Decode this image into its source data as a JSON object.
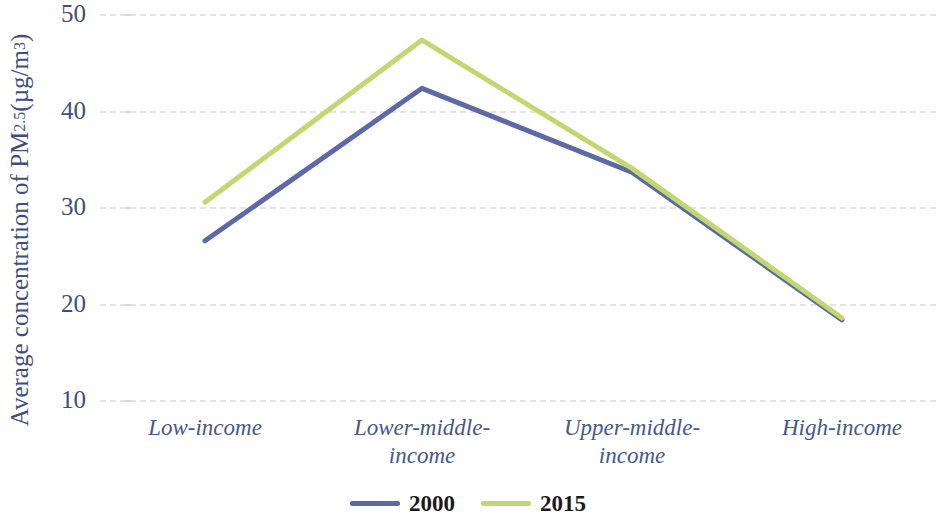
{
  "chart_data": {
    "type": "line",
    "title": "",
    "xlabel": "",
    "ylabel": "Average concentration of PM2.5 (µg/m³)",
    "ylabel_parts": {
      "prefix": "Average concentration of PM",
      "subscript": "2.5",
      "unit_open": " (µg/m",
      "superscript": "3",
      "unit_close": ")"
    },
    "categories": [
      "Low-income",
      "Lower-middle-income",
      "Upper-middle-income",
      "High-income"
    ],
    "category_lines": [
      [
        "Low-income"
      ],
      [
        "Lower-middle-",
        "income"
      ],
      [
        "Upper-middle-",
        "income"
      ],
      [
        "High-income"
      ]
    ],
    "series": [
      {
        "name": "2000",
        "color": "#5d69a6",
        "values": [
          26.5,
          42.3,
          33.6,
          18.3
        ]
      },
      {
        "name": "2015",
        "color": "#c1d870",
        "values": [
          30.5,
          47.3,
          34.0,
          18.5
        ]
      }
    ],
    "yticks": [
      50,
      40,
      30,
      20,
      10
    ],
    "ylim": [
      10,
      50
    ],
    "grid": true,
    "grid_style": "dashed",
    "grid_color": "#e3e3e6",
    "legend_position": "bottom",
    "axis_text_color": "#3f4f7a",
    "category_text_color": "#47578c",
    "legend_text_color": "#1b1b1b",
    "background": "#ffffff"
  }
}
